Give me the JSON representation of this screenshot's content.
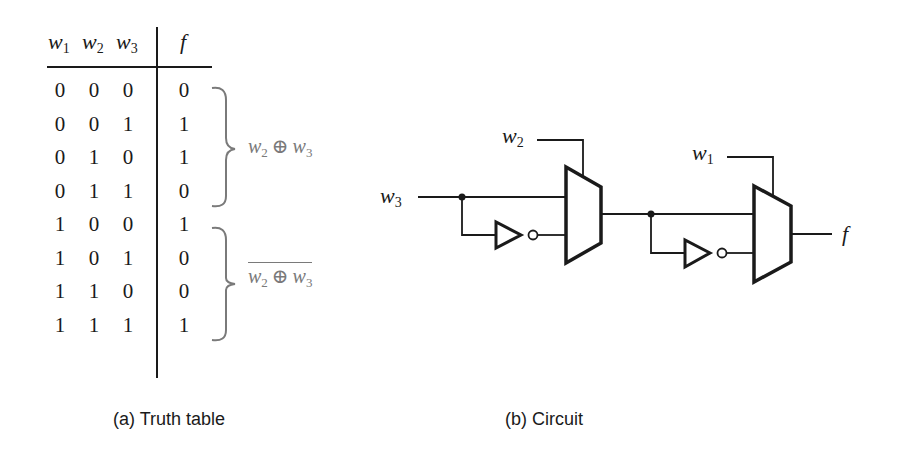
{
  "truth_table": {
    "headers": {
      "w1": {
        "base": "w",
        "sub": "1"
      },
      "w2": {
        "base": "w",
        "sub": "2"
      },
      "w3": {
        "base": "w",
        "sub": "3"
      },
      "f": "f"
    },
    "rows": [
      [
        "0",
        "0",
        "0",
        "0"
      ],
      [
        "0",
        "0",
        "1",
        "1"
      ],
      [
        "0",
        "1",
        "0",
        "1"
      ],
      [
        "0",
        "1",
        "1",
        "0"
      ],
      [
        "1",
        "0",
        "0",
        "1"
      ],
      [
        "1",
        "0",
        "1",
        "0"
      ],
      [
        "1",
        "1",
        "0",
        "0"
      ],
      [
        "1",
        "1",
        "1",
        "1"
      ]
    ],
    "annotations": [
      {
        "a": {
          "base": "w",
          "sub": "2"
        },
        "op": "⊕",
        "b": {
          "base": "w",
          "sub": "3"
        },
        "negated": false
      },
      {
        "a": {
          "base": "w",
          "sub": "2"
        },
        "op": "⊕",
        "b": {
          "base": "w",
          "sub": "3"
        },
        "negated": true
      }
    ],
    "caption": "(a) Truth table"
  },
  "circuit": {
    "inputs": {
      "w3": {
        "base": "w",
        "sub": "3"
      },
      "w2": {
        "base": "w",
        "sub": "2"
      },
      "w1": {
        "base": "w",
        "sub": "1"
      }
    },
    "output": "f",
    "components": [
      "mux-1 (select w2)",
      "inverter-1",
      "mux-2 (select w1)",
      "inverter-2"
    ],
    "caption": "(b) Circuit"
  },
  "colors": {
    "ink": "#1a1a1a",
    "annotation": "#7a7a7a"
  }
}
